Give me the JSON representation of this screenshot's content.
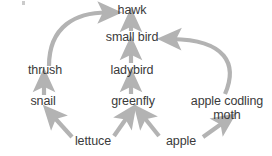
{
  "diagram": {
    "type": "food-web",
    "title": "",
    "background_color": "#ffffff",
    "text_color": "#3a3a3a",
    "arrow_color": "#b3b3b3",
    "nodes": [
      {
        "id": "hawk",
        "label": "hawk",
        "x": 132,
        "y": 11,
        "level": "tertiary-consumer"
      },
      {
        "id": "smallbird",
        "label": "small bird",
        "x": 132,
        "y": 38,
        "level": "secondary-consumer"
      },
      {
        "id": "ladybird",
        "label": "ladybird",
        "x": 132,
        "y": 71,
        "level": "secondary-consumer"
      },
      {
        "id": "thrush",
        "label": "thrush",
        "x": 45,
        "y": 71,
        "level": "secondary-consumer"
      },
      {
        "id": "snail",
        "label": "snail",
        "x": 43,
        "y": 102,
        "level": "primary-consumer"
      },
      {
        "id": "greenfly",
        "label": "greenfly",
        "x": 133,
        "y": 102,
        "level": "primary-consumer"
      },
      {
        "id": "moth",
        "label": "apple codling\nmoth",
        "x": 227,
        "y": 109,
        "level": "primary-consumer"
      },
      {
        "id": "lettuce",
        "label": "lettuce",
        "x": 93,
        "y": 142,
        "level": "producer"
      },
      {
        "id": "apple",
        "label": "apple",
        "x": 181,
        "y": 142,
        "level": "producer"
      }
    ],
    "arrows": [
      {
        "from": "small bird",
        "to": "hawk",
        "style": "straight"
      },
      {
        "from": "thrush",
        "to": "hawk",
        "style": "curved"
      },
      {
        "from": "ladybird",
        "to": "small bird",
        "style": "straight"
      },
      {
        "from": "apple codling moth",
        "to": "small bird",
        "style": "curved"
      },
      {
        "from": "snail",
        "to": "thrush",
        "style": "straight"
      },
      {
        "from": "greenfly",
        "to": "ladybird",
        "style": "straight"
      },
      {
        "from": "lettuce",
        "to": "snail",
        "style": "diagonal"
      },
      {
        "from": "lettuce",
        "to": "greenfly",
        "style": "diagonal"
      },
      {
        "from": "apple",
        "to": "greenfly",
        "style": "diagonal"
      },
      {
        "from": "apple",
        "to": "apple codling moth",
        "style": "diagonal"
      }
    ]
  }
}
